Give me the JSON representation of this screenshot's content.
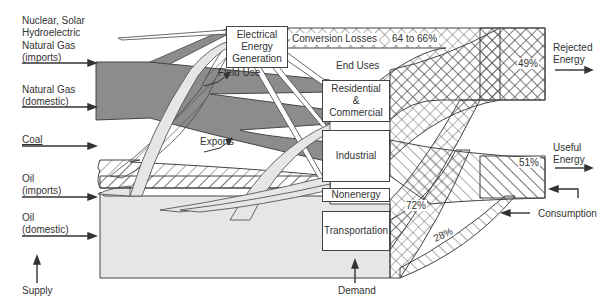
{
  "supply": {
    "title": "Supply",
    "sources": [
      {
        "label": "Nuclear, Solar\nHydroelectric",
        "line1": "Nuclear, Solar",
        "line2": "Hydroelectric"
      },
      {
        "label": "Natural Gas (imports)",
        "line1": "Natural Gas",
        "line2": "(imports)"
      },
      {
        "label": "Natural Gas (domestic)",
        "line1": "Natural Gas",
        "line2": "(domestic)"
      },
      {
        "label": "Coal",
        "line1": "Coal"
      },
      {
        "label": "Oil (imports)",
        "line1": "Oil",
        "line2": "(imports)"
      },
      {
        "label": "Oil (domestic)",
        "line1": "Oil",
        "line2": "(domestic)"
      }
    ]
  },
  "nodes": {
    "generation": {
      "line1": "Electrical",
      "line2": "Energy",
      "line3": "Generation"
    },
    "residential": {
      "line1": "Residential",
      "line2": "&",
      "line3": "Commercial"
    },
    "industrial": "Industrial",
    "nonenergy": "Nonenergy",
    "transportation": "Transportation"
  },
  "annotations": {
    "conversion_losses": "Conversion Losses",
    "conversion_losses_pct": "64 to 66%",
    "end_uses": "End Uses",
    "field_use": "Field Use",
    "exports": "Exports"
  },
  "outputs": {
    "rejected": {
      "line1": "Rejected",
      "line2": "Energy",
      "pct": "49%"
    },
    "useful": {
      "line1": "Useful",
      "line2": "Energy",
      "pct": "51%"
    },
    "transport_rejected_pct": "72%",
    "transport_useful_pct": "28%",
    "consumption": "Consumption",
    "demand": "Demand"
  },
  "colors": {
    "gas": "#8c8c8c",
    "oil": "#e6e6e6",
    "outline": "#444444",
    "background": "#ffffff"
  }
}
